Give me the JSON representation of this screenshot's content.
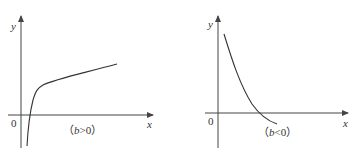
{
  "figures": [
    {
      "id": "left",
      "caption_prefix": "（",
      "caption_var": "b",
      "caption_rel": ">0）",
      "axis_x_label": "x",
      "axis_y_label": "y",
      "origin_label": "0",
      "curve_shape": "increasing-concave (logarithm-like), crosses x-axis just right of origin"
    },
    {
      "id": "right",
      "caption_prefix": "（",
      "caption_var": "b",
      "caption_rel": "<0）",
      "axis_x_label": "x",
      "axis_y_label": "y",
      "origin_label": "0",
      "curve_shape": "decreasing-convex, crosses x-axis and ends slightly below it"
    }
  ],
  "colors": {
    "axis": "#444444",
    "curve": "#333333",
    "text": "#333333"
  }
}
